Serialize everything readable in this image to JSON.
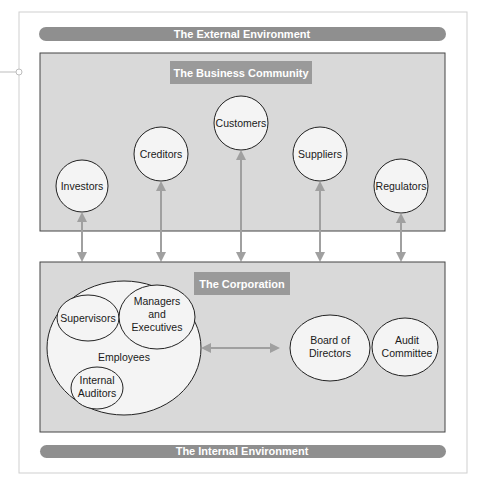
{
  "diagram": {
    "external_environment": {
      "label": "The External Environment"
    },
    "internal_environment": {
      "label": "The Internal Environment"
    },
    "business_community": {
      "title": "The Business Community",
      "stakeholders": [
        {
          "id": "investors",
          "label": "Investors"
        },
        {
          "id": "creditors",
          "label": "Creditors"
        },
        {
          "id": "customers",
          "label": "Customers"
        },
        {
          "id": "suppliers",
          "label": "Suppliers"
        },
        {
          "id": "regulators",
          "label": "Regulators"
        }
      ]
    },
    "corporation": {
      "title": "The Corporation",
      "employees": {
        "label": "Employees",
        "groups": [
          {
            "id": "supervisors",
            "lines": [
              "Supervisors"
            ]
          },
          {
            "id": "managers",
            "lines": [
              "Managers",
              "and",
              "Executives"
            ]
          },
          {
            "id": "internal-auditors",
            "lines": [
              "Internal",
              "Auditors"
            ]
          }
        ]
      },
      "board": {
        "lines": [
          "Board of",
          "Directors"
        ]
      },
      "audit_committee": {
        "lines": [
          "Audit",
          "Committee"
        ]
      }
    },
    "relationships": [
      {
        "from": "investors",
        "to": "corporation",
        "type": "bidirectional"
      },
      {
        "from": "creditors",
        "to": "corporation",
        "type": "bidirectional"
      },
      {
        "from": "customers",
        "to": "corporation",
        "type": "bidirectional"
      },
      {
        "from": "suppliers",
        "to": "corporation",
        "type": "bidirectional"
      },
      {
        "from": "regulators",
        "to": "corporation",
        "type": "bidirectional"
      },
      {
        "from": "employees",
        "to": "board",
        "type": "bidirectional"
      }
    ],
    "colors": {
      "band": "#8f8f8f",
      "box_fill": "#d9d9d9",
      "title_fill": "#9a9a9a",
      "circle_fill": "#f4f4f4",
      "arrow": "#a0a0a0",
      "frame": "#cfcfcf"
    }
  }
}
